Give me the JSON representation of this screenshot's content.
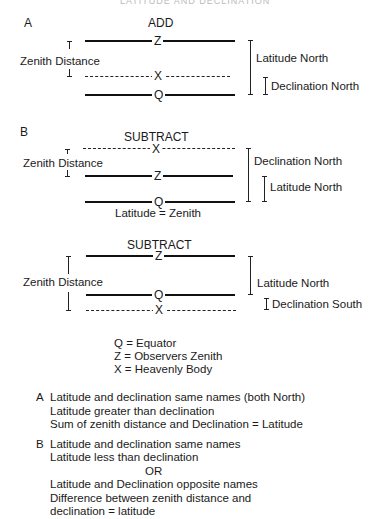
{
  "header": {
    "text": "LATITUDE AND DECLINATION"
  },
  "diagram_a": {
    "section_label": "A",
    "operation": "ADD",
    "zenith_distance_label": "Zenith Distance",
    "points": {
      "z": "Z",
      "x": "X",
      "q": "Q"
    },
    "right_labels": {
      "outer": "Latitude North",
      "inner": "Declination North"
    }
  },
  "diagram_b1": {
    "section_label": "B",
    "operation": "SUBTRACT",
    "zenith_distance_label": "Zenith Distance",
    "points": {
      "x": "X",
      "z": "Z",
      "q": "Q"
    },
    "right_labels": {
      "outer": "Declination North",
      "inner": "Latitude North"
    },
    "caption": "Latitude = Zenith"
  },
  "diagram_b2": {
    "operation": "SUBTRACT",
    "zenith_distance_label": "Zenith Distance",
    "points": {
      "z": "Z",
      "q": "Q",
      "x": "X"
    },
    "right_labels": {
      "outer": "Latitude North",
      "inner": "Declination South"
    }
  },
  "legend": [
    "Q = Equator",
    "Z = Observers Zenith",
    "X = Heavenly Body"
  ],
  "notes": {
    "a": {
      "letter": "A",
      "lines": [
        "Latitude and declination same names (both North)",
        "Latitude greater than declination",
        "Sum of zenith distance and Declination = Latitude"
      ]
    },
    "b": {
      "letter": "B",
      "lines": [
        "Latitude and declination same names",
        "Latitude less than declination"
      ],
      "or": "OR",
      "lines_after": [
        "Latitude and Declination opposite names",
        "Difference between zenith distance and",
        "declination = latitude"
      ]
    }
  }
}
